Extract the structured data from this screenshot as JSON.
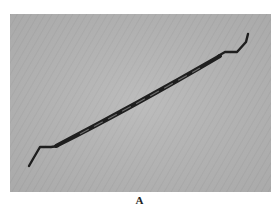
{
  "figure": {
    "caption": "A",
    "colors": {
      "background": "#b3b3b3",
      "instrument": "#1e1e1e",
      "page": "#ffffff"
    }
  }
}
